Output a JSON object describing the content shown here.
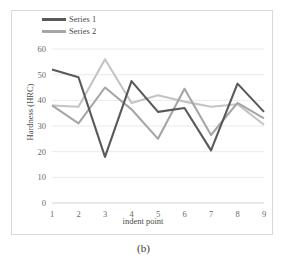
{
  "figure": {
    "caption": "(b)"
  },
  "chart_data": {
    "type": "line",
    "title": "",
    "xlabel": "indent point",
    "ylabel": "Hardness (HRC)",
    "categories": [
      "1",
      "2",
      "3",
      "4",
      "5",
      "6",
      "7",
      "8",
      "9"
    ],
    "x": [
      1,
      2,
      3,
      4,
      5,
      6,
      7,
      8,
      9
    ],
    "xlim": [
      1,
      9
    ],
    "ylim": [
      0,
      60
    ],
    "yticks": [
      0,
      10,
      20,
      30,
      40,
      50,
      60
    ],
    "ytick_labels": [
      "0",
      "10",
      "20",
      "30",
      "40",
      "50",
      "60"
    ],
    "grid": true,
    "grid_axis": "y",
    "legend_position": "top-left",
    "series": [
      {
        "name": "Series 1",
        "color": "#595959",
        "in_legend": true,
        "values": [
          52,
          49,
          18,
          47.5,
          35.5,
          37,
          20.5,
          46.5,
          35.5
        ]
      },
      {
        "name": "Series 2",
        "color": "#A6A6A6",
        "in_legend": true,
        "values": [
          38,
          31,
          45,
          36.5,
          25,
          44.5,
          26.5,
          39,
          33
        ]
      },
      {
        "name": "Series 3",
        "color": "#C4C4C4",
        "in_legend": false,
        "values": [
          38,
          37.5,
          56,
          39,
          42,
          39.5,
          37.5,
          38.5,
          30.5
        ]
      }
    ]
  },
  "legend": {
    "entries": [
      {
        "label": "Series 1",
        "color": "#595959"
      },
      {
        "label": "Series 2",
        "color": "#A6A6A6"
      }
    ]
  }
}
